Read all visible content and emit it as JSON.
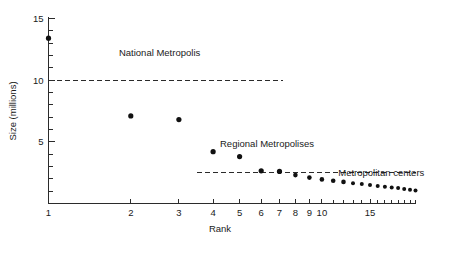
{
  "chart_data": {
    "type": "scatter",
    "title": "",
    "xlabel": "Rank",
    "ylabel": "Size (millions)",
    "xscale": "log",
    "yscale": "linear",
    "xlim": [
      1,
      22
    ],
    "ylim": [
      0,
      15
    ],
    "grid": false,
    "legend": "none",
    "x_ticks_labeled": [
      1,
      2,
      3,
      4,
      5,
      6,
      7,
      8,
      9,
      10,
      15
    ],
    "x_tick_labels": [
      "1",
      "2",
      "3",
      "4",
      "5",
      "6",
      "7",
      "8",
      "9",
      "10",
      "15"
    ],
    "x_ticks_minor": [
      11,
      12,
      13,
      14,
      16,
      17,
      18,
      19,
      20,
      21,
      22
    ],
    "y_ticks_labeled": [
      5,
      10,
      15
    ],
    "y_tick_labels": [
      "5",
      "10",
      "15"
    ],
    "y_ticks_minor": [
      1,
      2,
      3,
      4,
      6,
      7,
      8,
      9,
      11,
      12,
      13,
      14
    ],
    "points": [
      {
        "rank": 1,
        "size": 13.4
      },
      {
        "rank": 2,
        "size": 7.1
      },
      {
        "rank": 3,
        "size": 6.8
      },
      {
        "rank": 4,
        "size": 4.2
      },
      {
        "rank": 5,
        "size": 3.8
      },
      {
        "rank": 6,
        "size": 2.65
      },
      {
        "rank": 7,
        "size": 2.6
      },
      {
        "rank": 8,
        "size": 2.3
      },
      {
        "rank": 9,
        "size": 2.1
      },
      {
        "rank": 10,
        "size": 1.95
      },
      {
        "rank": 11,
        "size": 1.85
      },
      {
        "rank": 12,
        "size": 1.75
      },
      {
        "rank": 13,
        "size": 1.65
      },
      {
        "rank": 14,
        "size": 1.58
      },
      {
        "rank": 15,
        "size": 1.5
      },
      {
        "rank": 16,
        "size": 1.42
      },
      {
        "rank": 17,
        "size": 1.35
      },
      {
        "rank": 18,
        "size": 1.3
      },
      {
        "rank": 19,
        "size": 1.25
      },
      {
        "rank": 20,
        "size": 1.18
      },
      {
        "rank": 21,
        "size": 1.12
      },
      {
        "rank": 22,
        "size": 1.05
      }
    ],
    "reference_lines": [
      {
        "name": "national-threshold",
        "value": 10,
        "from_rank": 1,
        "to_rank": 7.2,
        "style": "dashed"
      },
      {
        "name": "regional-threshold",
        "value": 2.55,
        "from_rank": 3.5,
        "to_rank": 22,
        "style": "dashed"
      }
    ],
    "annotations": [
      {
        "name": "national-metropolis",
        "text": "National Metropolis",
        "rank": 2.55,
        "size": 12.0
      },
      {
        "name": "regional-metropolises",
        "text": "Regional Metropolises",
        "rank": 6.3,
        "size": 4.55
      },
      {
        "name": "metropolitan-centers",
        "text": "Metropolitan centers",
        "rank": 16.5,
        "size": 2.2
      }
    ]
  },
  "axes": {
    "x_axis_title": "Rank",
    "y_axis_title": "Size (millions)"
  },
  "colors": {
    "point": "#111111",
    "axis": "#2b2b2b",
    "text": "#1a1a1a",
    "background": "#ffffff"
  }
}
